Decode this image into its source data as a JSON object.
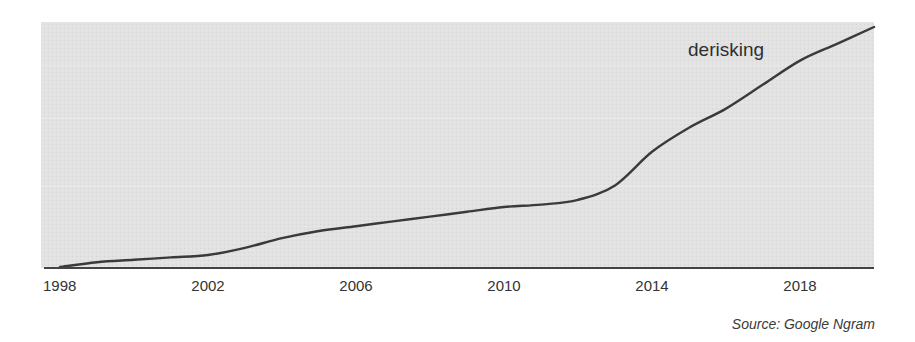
{
  "chart_data": {
    "type": "line",
    "title": "",
    "xlabel": "",
    "ylabel": "",
    "series_label": "derisking",
    "x_ticks": [
      "1998",
      "2002",
      "2006",
      "2010",
      "2014",
      "2018"
    ],
    "xlim": [
      1998,
      2020
    ],
    "ylim": [
      0,
      100
    ],
    "y_axis_labeled": false,
    "grid": false,
    "series": [
      {
        "name": "derisking",
        "x": [
          1998,
          1999,
          2000,
          2001,
          2002,
          2003,
          2004,
          2005,
          2006,
          2007,
          2008,
          2009,
          2010,
          2011,
          2012,
          2013,
          2014,
          2015,
          2016,
          2017,
          2018,
          2019,
          2020
        ],
        "values": [
          0,
          2,
          3,
          4,
          5,
          8,
          12,
          15,
          17,
          19,
          21,
          23,
          25,
          26,
          28,
          34,
          48,
          58,
          66,
          76,
          86,
          93,
          100
        ]
      }
    ],
    "source": "Source: Google Ngram",
    "colors": {
      "plot_background": "#e4e4e4",
      "line": "#3a3a3a",
      "axis": "#444444"
    }
  }
}
